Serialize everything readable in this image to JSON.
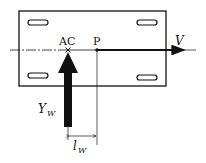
{
  "diagram": {
    "type": "wing-force-schematic",
    "labels": {
      "aerodynamic_center": "AC",
      "point": "P",
      "velocity": "V",
      "force_main": "Y",
      "force_sub": "W",
      "arm_main": "l",
      "arm_sub": "W"
    },
    "colors": {
      "stroke": "#111111",
      "background": "#ffffff"
    }
  }
}
